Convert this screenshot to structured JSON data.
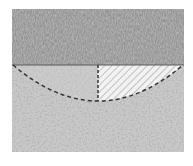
{
  "diagram": {
    "type": "soil-cross-section",
    "colors": {
      "background": "#ffffff",
      "upper_layer": "#8a8a8a",
      "lower_layer": "#c9c9c9",
      "hatched_region_fill": "#ececec",
      "hatch_lines": "#9a9a9a",
      "dashed_lines": "#333333"
    },
    "layers": [
      {
        "name": "upper-layer",
        "texture": "dense-dark-grain"
      },
      {
        "name": "lower-layer",
        "texture": "light-speckled"
      }
    ],
    "features": [
      {
        "name": "circular-slip-arc",
        "style": "dashed"
      },
      {
        "name": "vertical-centerline",
        "style": "dashed"
      },
      {
        "name": "hatched-half-segment",
        "style": "diagonal-hatch"
      }
    ]
  }
}
